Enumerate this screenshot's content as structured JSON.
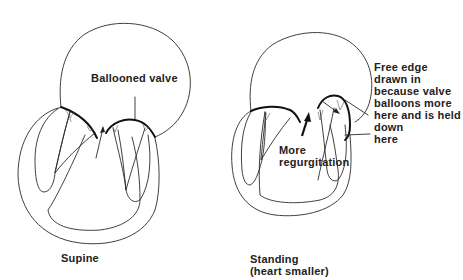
{
  "figure": {
    "panels": [
      {
        "id": "supine",
        "caption": [
          "Supine"
        ],
        "annotation": "Ballooned valve"
      },
      {
        "id": "standing",
        "caption": [
          "Standing",
          "(heart smaller)"
        ],
        "annotations": {
          "regurgitation": [
            "More",
            "regurgitation"
          ],
          "free_edge": [
            "Free edge",
            "drawn in",
            "because valve",
            "balloons more",
            "here and is held",
            "down",
            "here"
          ]
        }
      }
    ]
  }
}
